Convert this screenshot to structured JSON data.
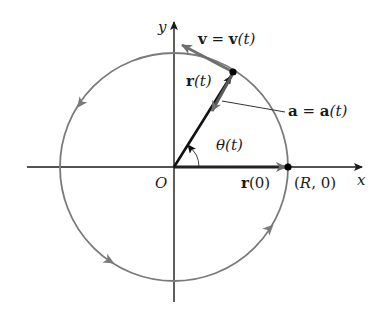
{
  "diagram": {
    "type": "uniform-circular-motion",
    "colors": {
      "axis": "#1a1a1a",
      "circle": "#7a7a7a",
      "vector_r": "#111111",
      "vector_v": "#6e6e6e",
      "vector_a": "#5a5a5a",
      "point": "#000000"
    },
    "geometry": {
      "origin": [
        174,
        167
      ],
      "radius": 114,
      "point_P": [
        233,
        72
      ],
      "velocity_tip": [
        180,
        44
      ],
      "accel_tip": [
        211,
        114
      ],
      "r0_tip": [
        288,
        167
      ]
    },
    "labels": {
      "y_axis": "y",
      "x_axis": "x",
      "origin": "O",
      "velocity_bold": "v",
      "velocity_eq": " = ",
      "velocity_bold2": "v",
      "velocity_arg": "(t)",
      "position_bold": "r",
      "position_arg": "(t)",
      "accel_bold": "a",
      "accel_eq": " = ",
      "accel_bold2": "a",
      "accel_arg": "(t)",
      "angle": "θ",
      "angle_arg": "(t)",
      "initial_pos_bold": "r",
      "initial_pos_arg": "(0)",
      "point_coords_open": "(",
      "point_coords_R": "R",
      "point_coords_rest": ", 0)"
    }
  }
}
